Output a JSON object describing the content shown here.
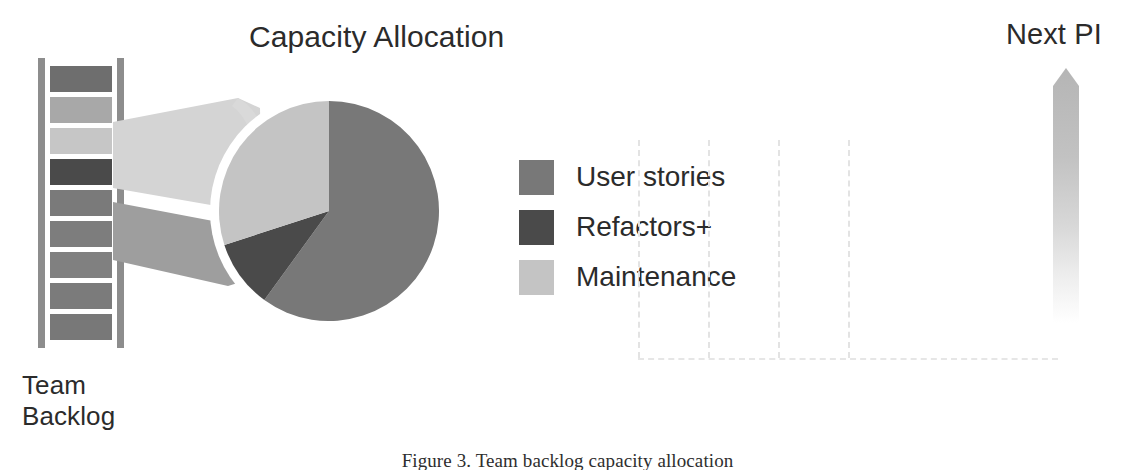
{
  "figure": {
    "caption": "Figure 3. Team backlog capacity allocation"
  },
  "chart_title": "Capacity Allocation",
  "backlog": {
    "label": "Team\nBacklog",
    "items": [
      {
        "name": "backlog-item-1",
        "shade": "#6e6e6e"
      },
      {
        "name": "backlog-item-2",
        "shade": "#a8a8a8"
      },
      {
        "name": "backlog-item-3",
        "shade": "#c6c6c6"
      },
      {
        "name": "backlog-item-4",
        "shade": "#4a4a4a"
      },
      {
        "name": "backlog-item-5",
        "shade": "#7a7a7a"
      },
      {
        "name": "backlog-item-6",
        "shade": "#7d7d7d"
      },
      {
        "name": "backlog-item-7",
        "shade": "#808080"
      },
      {
        "name": "backlog-item-8",
        "shade": "#7b7b7b"
      },
      {
        "name": "backlog-item-9",
        "shade": "#787878"
      }
    ]
  },
  "legend": {
    "items": [
      {
        "label": "User stories",
        "color": "#787878"
      },
      {
        "label": "Refactors+",
        "color": "#4a4a4a"
      },
      {
        "label": "Maintenance",
        "color": "#c4c4c4"
      }
    ]
  },
  "next_pi": {
    "label": "Next PI"
  },
  "colors": {
    "user_stories": "#787878",
    "refactors": "#4a4a4a",
    "maintenance": "#c4c4c4",
    "callout_upper": "#d2d2d2",
    "callout_lower": "#9e9e9e",
    "rail": "#8d8d8d",
    "grid_dash": "#e3e3e3",
    "arrow_top": "#b9b9b9",
    "text": "#2b2b2b"
  },
  "grid": {
    "vertical_line_count": 4,
    "vertical_line_x": [
      8,
      78,
      148,
      218
    ]
  },
  "chart_data": {
    "type": "pie",
    "title": "Capacity Allocation",
    "labels": [
      "User stories",
      "Refactors+",
      "Maintenance"
    ],
    "values": [
      60,
      10,
      30
    ],
    "unit": "percent",
    "colors": [
      "#787878",
      "#4a4a4a",
      "#c4c4c4"
    ],
    "legend_position": "right",
    "start_angle_deg": 0,
    "direction": "clockwise",
    "annotations": [
      "Team Backlog",
      "Next PI"
    ],
    "xlabel": "",
    "ylabel": "",
    "grid": false
  }
}
